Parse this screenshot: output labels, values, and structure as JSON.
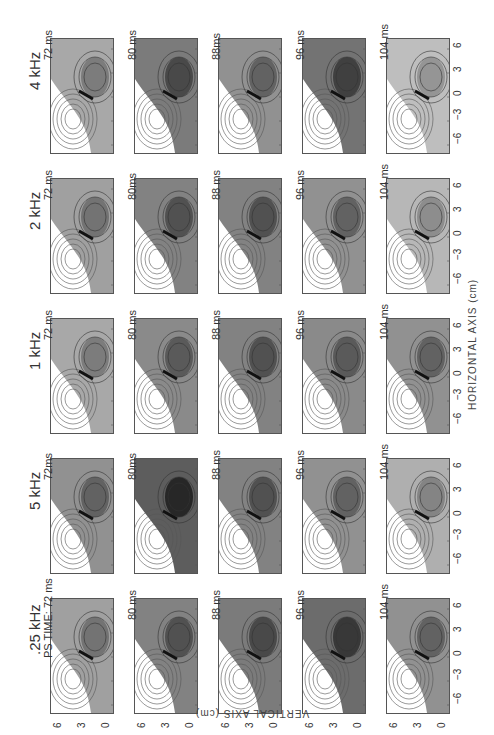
{
  "chart_data": {
    "type": "heatmap",
    "title": "",
    "layout": "5x5 grid of contour maps (rotated 90°)",
    "rows": [
      {
        "label": "4 kHz",
        "times": [
          "72 ms",
          "80 ms",
          "88ms",
          "96 ms",
          "104 ms"
        ]
      },
      {
        "label": "2 kHz",
        "times": [
          "72 ms",
          "80ms",
          "88 ms",
          "96 ms",
          "104 ms"
        ]
      },
      {
        "label": "1 kHz",
        "times": [
          "72 ms",
          "80 ms",
          "88 ms",
          "96 ms",
          "104 ms"
        ]
      },
      {
        "label": "5 kHz",
        "times": [
          "72ms",
          "80ms",
          "88 ms",
          "96 ms",
          "104 ms"
        ]
      },
      {
        "label": ".25 kHz",
        "times": [
          "PS TIME: 72 ms",
          "80 ms",
          "88 ms",
          "96 ms",
          "104 ms"
        ]
      }
    ],
    "xlabel": "HORIZONTAL AXIS (cm)",
    "ylabel": "VERTICAL AXIS (cm)",
    "horizontal_ticks": [
      "6",
      "3",
      "0",
      "-3",
      "-6"
    ],
    "vertical_ticks": [
      "6",
      "3",
      "0"
    ],
    "xlim": [
      -6,
      6
    ],
    "ylim": [
      -1,
      6
    ]
  },
  "labels": {
    "rows": [
      "4 kHz",
      "2 kHz",
      "1 kHz",
      "5 kHz",
      ".25 kHz"
    ],
    "xaxis": "HORIZONTAL AXIS (cm)",
    "yaxis": "VERTICAL AXIS (cm)",
    "htick": [
      "6",
      "3",
      "0",
      "−3",
      "−6"
    ],
    "vtick": [
      "6",
      "3",
      "0"
    ],
    "t": [
      [
        "72 ms",
        "80 ms",
        "88ms",
        "96 ms",
        "104 ms"
      ],
      [
        "72 ms",
        "80ms",
        "88 ms",
        "96 ms",
        "104 ms"
      ],
      [
        "72 ms",
        "80 ms",
        "88 ms",
        "96 ms",
        "104 ms"
      ],
      [
        "72ms",
        "80ms",
        "88 ms",
        "96 ms",
        "104 ms"
      ],
      [
        "PS TIME: 72 ms",
        "80 ms",
        "88 ms",
        "96 ms",
        "104 ms"
      ]
    ]
  }
}
